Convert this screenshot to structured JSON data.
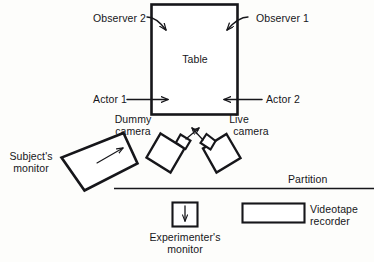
{
  "figure": {
    "type": "schematic-floor-plan",
    "background_color": "#fdfdfb",
    "ink_color": "#16161a"
  },
  "labels": {
    "observer_2": "Observer 2",
    "observer_1": "Observer 1",
    "table": "Table",
    "actor_1": "Actor 1",
    "actor_2": "Actor 2",
    "dummy_camera_line1": "Dummy",
    "dummy_camera_line2": "camera",
    "live_camera_line1": "Live",
    "live_camera_line2": "camera",
    "subjects_monitor_line1": "Subject's",
    "subjects_monitor_line2": "monitor",
    "partition": "Partition",
    "experimenters_monitor_line1": "Experimenter's",
    "experimenters_monitor_line2": "monitor",
    "videotape_recorder_line1": "Videotape",
    "videotape_recorder_line2": "recorder"
  },
  "elements": [
    {
      "name": "table",
      "shape": "rectangle",
      "label": "Table"
    },
    {
      "name": "subjects-monitor",
      "shape": "rotated-rectangle",
      "label": "Subject's monitor"
    },
    {
      "name": "dummy-camera",
      "shape": "rotated-square-with-lens",
      "label": "Dummy camera"
    },
    {
      "name": "live-camera",
      "shape": "rotated-square-with-lens",
      "label": "Live camera"
    },
    {
      "name": "partition",
      "shape": "horizontal-line",
      "label": "Partition"
    },
    {
      "name": "experimenters-monitor",
      "shape": "small-square",
      "label": "Experimenter's monitor"
    },
    {
      "name": "videotape-recorder",
      "shape": "rectangle",
      "label": "Videotape recorder"
    }
  ],
  "pointers": [
    {
      "name": "observer-2-pointer",
      "from": "Observer 2",
      "to": "table-top-left"
    },
    {
      "name": "observer-1-pointer",
      "from": "Observer 1",
      "to": "table-top-right"
    },
    {
      "name": "actor-1-pointer",
      "from": "Actor 1",
      "to": "table-bottom-left"
    },
    {
      "name": "actor-2-pointer",
      "from": "Actor 2",
      "to": "table-bottom-right"
    },
    {
      "name": "subjects-monitor-view-arrow",
      "from": "subjects-monitor",
      "to": "upper-right"
    },
    {
      "name": "dummy-camera-aim-arrow",
      "from": "dummy-camera",
      "to": "upper-right"
    },
    {
      "name": "live-camera-aim-arrow",
      "from": "live-camera",
      "to": "upper-left"
    },
    {
      "name": "experimenters-monitor-arrow",
      "from": "experimenters-monitor",
      "to": "down"
    }
  ]
}
